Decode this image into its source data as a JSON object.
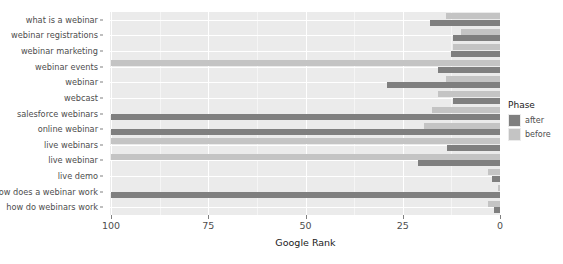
{
  "chart_data": {
    "type": "bar",
    "orientation": "horizontal",
    "title": "",
    "subtitle": "",
    "xlabel": "Google Rank",
    "ylabel": "",
    "xlim": [
      100,
      0
    ],
    "x_reversed": true,
    "xticks": [
      100,
      75,
      50,
      25,
      0
    ],
    "xticklabels": [
      "100",
      "75",
      "50",
      "25",
      "0"
    ],
    "grid": true,
    "grid_color": "#ffffff",
    "panel_background": "#ebebeb",
    "legend": {
      "title": "Phase",
      "position": "right",
      "entries": [
        {
          "label": "after",
          "color": "#7f7f7f"
        },
        {
          "label": "before",
          "color": "#c4c4c4"
        }
      ]
    },
    "categories": [
      "what is a webinar",
      "webinar registrations",
      "webinar marketing",
      "webinar events",
      "webinar",
      "webcast",
      "salesforce webinars",
      "online webinar",
      "live webinars",
      "live webinar",
      "live demo",
      "how does a webinar work",
      "how do webinars work"
    ],
    "series": [
      {
        "name": "before",
        "color": "#c4c4c4",
        "values": [
          14,
          10,
          12,
          100,
          14,
          16,
          17.5,
          19.5,
          100,
          100,
          3,
          0.5,
          3
        ]
      },
      {
        "name": "after",
        "color": "#7f7f7f",
        "values": [
          18,
          12,
          12.5,
          16,
          29,
          12,
          100,
          100,
          13.5,
          21,
          2,
          100,
          1.5
        ]
      }
    ]
  },
  "axis": {
    "x_title": "Google Rank"
  },
  "legend": {
    "title": "Phase",
    "items": [
      {
        "label": "after"
      },
      {
        "label": "before"
      }
    ]
  }
}
